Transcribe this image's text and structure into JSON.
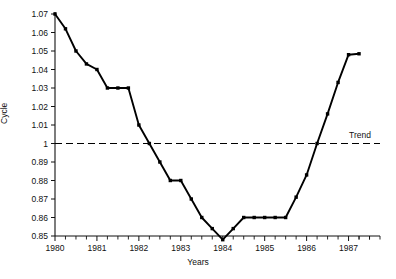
{
  "chart_data": {
    "type": "line",
    "title": "",
    "xlabel": "Years",
    "ylabel": "Cycle",
    "grid": false,
    "legend": "none",
    "xlim": [
      1980,
      1987.75
    ],
    "ylim": [
      0.85,
      1.07
    ],
    "x_tick_labels": [
      "1980",
      "1981",
      "1982",
      "1983",
      "1984",
      "1985",
      "1986",
      "1987"
    ],
    "x_tick_values": [
      1980,
      1981,
      1982,
      1983,
      1984,
      1985,
      1986,
      1987
    ],
    "x_minor_ticks_per_interval": 4,
    "y_tick_labels": [
      "1.07",
      "1.06",
      "1.05",
      "1.04",
      "1.03",
      "1.02",
      "1.01",
      "1",
      "0.89",
      "0.88",
      "0.87",
      "0.86",
      "0.85"
    ],
    "y_tick_index": [
      12,
      11,
      10,
      9,
      8,
      7,
      6,
      5,
      4,
      3,
      2,
      1,
      0
    ],
    "series": [
      {
        "name": "Cycle",
        "marker": "filled-square",
        "style": "solid",
        "color": "#000000",
        "x": [
          1980.0,
          1980.25,
          1980.5,
          1980.75,
          1981.0,
          1981.25,
          1981.5,
          1981.75,
          1982.0,
          1982.25,
          1982.5,
          1982.75,
          1983.0,
          1983.25,
          1983.5,
          1983.75,
          1984.0,
          1984.25,
          1984.5,
          1984.75,
          1985.0,
          1985.25,
          1985.5,
          1985.75,
          1986.0,
          1986.25,
          1986.5,
          1986.75,
          1987.0,
          1987.25
        ],
        "y_index": [
          12.0,
          11.2,
          10.0,
          9.3,
          9.0,
          8.0,
          8.0,
          8.0,
          6.0,
          5.0,
          4.0,
          3.0,
          3.0,
          2.0,
          1.0,
          0.4,
          -0.2,
          0.4,
          1.0,
          1.0,
          1.0,
          1.0,
          1.0,
          2.1,
          3.3,
          5.0,
          6.6,
          8.3,
          9.8,
          9.85
        ],
        "y_values": [
          1.07,
          1.062,
          1.05,
          1.043,
          1.04,
          1.03,
          1.03,
          1.03,
          1.01,
          1.0,
          0.89,
          0.88,
          0.88,
          0.87,
          0.86,
          0.854,
          0.848,
          0.854,
          0.86,
          0.86,
          0.86,
          0.86,
          0.86,
          0.871,
          0.883,
          1.0,
          1.016,
          1.033,
          1.048,
          1.0485
        ]
      }
    ],
    "trend": {
      "label": "Trend",
      "style": "dashed",
      "color": "#000000",
      "y_index": 5,
      "y_value": 1.0,
      "x_start": 1980,
      "x_end": 1987.75
    }
  }
}
